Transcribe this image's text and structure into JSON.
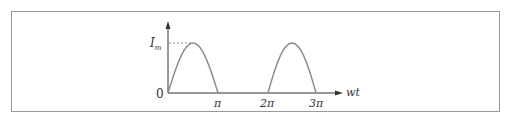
{
  "diagram": {
    "title": "",
    "y_axis_label": "I",
    "y_axis_sub": "m",
    "x_axis_label": "wt",
    "origin_label": "0",
    "x_ticks": [
      "π",
      "2π",
      "3π"
    ],
    "colors": {
      "curve": "#8a8a8a",
      "axis": "#333333",
      "frame": "#9a9a9a"
    }
  }
}
